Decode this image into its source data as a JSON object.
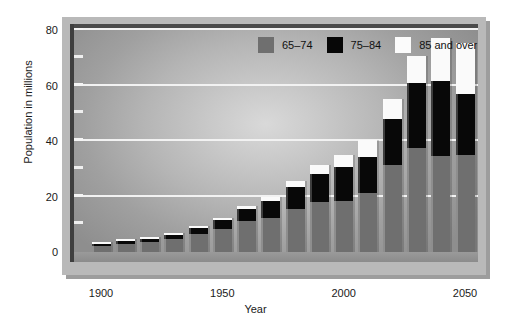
{
  "chart_data": {
    "type": "bar",
    "stacked": true,
    "title": "",
    "xlabel": "Year",
    "ylabel": "Population in millions",
    "ylim": [
      0,
      80
    ],
    "yticks": [
      0,
      20,
      40,
      60,
      80
    ],
    "yticks_minor": [
      10,
      30,
      50,
      70
    ],
    "xticks": [
      1900,
      1950,
      2000,
      2050
    ],
    "grid": true,
    "legend_position": "top-right",
    "categories": [
      1900,
      1910,
      1920,
      1930,
      1940,
      1950,
      1960,
      1970,
      1980,
      1990,
      2000,
      2010,
      2020,
      2030,
      2040,
      2050
    ],
    "series": [
      {
        "name": "65-74",
        "color": "#6f6f6f",
        "values": [
          2.2,
          2.8,
          3.5,
          4.7,
          6.4,
          8.4,
          11.0,
          12.4,
          15.6,
          18.1,
          18.4,
          21.1,
          31.4,
          37.4,
          34.7,
          34.9
        ]
      },
      {
        "name": "75-84",
        "color": "#080808",
        "values": [
          0.8,
          1.0,
          1.3,
          1.6,
          2.3,
          3.3,
          4.6,
          6.1,
          7.7,
          10.1,
          12.4,
          13.1,
          16.5,
          23.5,
          27.0,
          22.1
        ]
      },
      {
        "name": "85 and over",
        "color": "#fafafa",
        "values": [
          0.1,
          0.2,
          0.2,
          0.3,
          0.4,
          0.6,
          0.9,
          1.4,
          2.2,
          3.1,
          4.3,
          6.1,
          7.3,
          9.6,
          15.4,
          18.2
        ]
      }
    ],
    "totals": [
      3.1,
      4.0,
      5.0,
      6.6,
      9.1,
      12.3,
      16.5,
      19.9,
      25.5,
      31.3,
      35.1,
      40.3,
      55.2,
      70.5,
      77.1,
      75.2
    ]
  },
  "legend": {
    "items": [
      {
        "label": "65–74",
        "swatch": "series-a-swatch"
      },
      {
        "label": "75–84",
        "swatch": "series-b-swatch"
      },
      {
        "label": "85 and over",
        "swatch": "series-c-swatch"
      }
    ]
  },
  "axes": {
    "y_title": "Population in millions",
    "x_title": "Year",
    "y_tick_labels": [
      "0",
      "20",
      "40",
      "60",
      "80"
    ],
    "x_tick_labels": [
      "1900",
      "1950",
      "2000",
      "2050"
    ]
  },
  "colors": {
    "series_a": "#6f6f6f",
    "series_b": "#080808",
    "series_c": "#fafafa",
    "gridline": "#f2f2f2",
    "panel_frame": "#b9b9b9",
    "text": "#1a1a1a"
  }
}
